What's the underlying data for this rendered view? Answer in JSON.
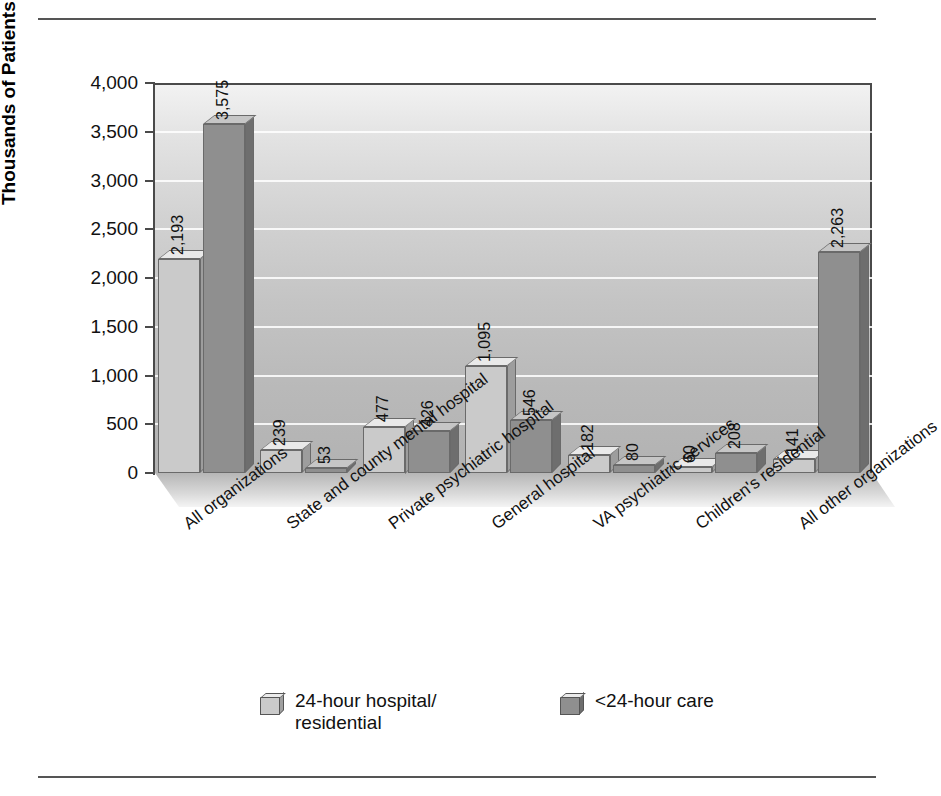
{
  "chart_data": {
    "type": "bar",
    "title": "",
    "xlabel": "",
    "ylabel": "Thousands of Patients",
    "ylim": [
      0,
      4000
    ],
    "ytick_values": [
      0,
      500,
      1000,
      1500,
      2000,
      2500,
      3000,
      3500,
      4000
    ],
    "ytick_labels": [
      "0",
      "500",
      "1,000",
      "1,500",
      "2,000",
      "2,500",
      "3,000",
      "3,500",
      "4,000"
    ],
    "grid": true,
    "legend_position": "bottom",
    "categories": [
      "All organizations",
      "State and county mental hospital",
      "Private psychiatric hospital",
      "General hospital",
      "VA psychiatric services",
      "Children's residential",
      "All other organizations"
    ],
    "series": [
      {
        "name": "24-hour hospital/\nresidential",
        "color": "#cacaca",
        "values": [
          2193,
          239,
          477,
          1095,
          182,
          60,
          141
        ],
        "value_labels": [
          "2,193",
          "239",
          "477",
          "1,095",
          "182",
          "60",
          "141"
        ]
      },
      {
        "name": "<24-hour care",
        "color": "#8f8f8f",
        "values": [
          3575,
          53,
          426,
          546,
          80,
          208,
          2263
        ],
        "value_labels": [
          "3,575",
          "53",
          "426",
          "546",
          "80",
          "208",
          "2,263"
        ]
      }
    ]
  },
  "legend": [
    {
      "label_line1": "24-hour hospital/",
      "label_line2": "residential",
      "swatch": "light"
    },
    {
      "label_line1": "<24-hour care",
      "label_line2": "",
      "swatch": "dark"
    }
  ],
  "colors": {
    "series_light": "#cacaca",
    "series_dark": "#8f8f8f",
    "axis": "#4a4a4a",
    "gridline": "#ffffff",
    "text": "#111111"
  }
}
